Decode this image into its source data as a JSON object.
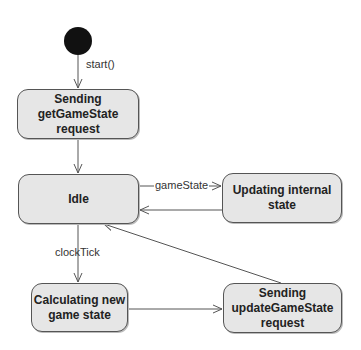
{
  "diagram": {
    "type": "UML state machine",
    "initial_state": {
      "shape": "filled-circle",
      "color": "#111111"
    },
    "states": [
      {
        "id": "sending-get",
        "label": "Sending\ngetGameState\nrequest"
      },
      {
        "id": "idle",
        "label": "Idle"
      },
      {
        "id": "updating",
        "label": "Updating internal\nstate"
      },
      {
        "id": "calculating",
        "label": "Calculating new\ngame state"
      },
      {
        "id": "sending-update",
        "label": "Sending\nupdateGameState\nrequest"
      }
    ],
    "transitions": [
      {
        "from": "initial",
        "to": "sending-get",
        "label": "start()"
      },
      {
        "from": "sending-get",
        "to": "idle",
        "label": ""
      },
      {
        "from": "idle",
        "to": "updating",
        "label": "gameState"
      },
      {
        "from": "updating",
        "to": "idle",
        "label": ""
      },
      {
        "from": "idle",
        "to": "calculating",
        "label": "clockTick"
      },
      {
        "from": "calculating",
        "to": "sending-update",
        "label": ""
      },
      {
        "from": "sending-update",
        "to": "idle",
        "label": ""
      }
    ],
    "colors": {
      "state_fill": "#e6e6e6",
      "stroke": "#555555",
      "initial": "#111111"
    }
  }
}
